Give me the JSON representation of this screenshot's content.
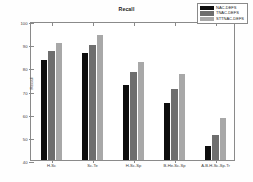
{
  "chart_data": {
    "type": "bar",
    "title": "Recall",
    "xlabel": "",
    "ylabel": "Recall",
    "ylim": [
      40,
      100
    ],
    "yticks": [
      40,
      50,
      60,
      70,
      80,
      90,
      100
    ],
    "grid": false,
    "legend_position": "top-right",
    "categories": [
      "H-Sc",
      "Sc-Te",
      "H-Sc-Sp",
      "B-He-Sc-Sp",
      "A-B-H-Sc-Sp-Tr"
    ],
    "series": [
      {
        "name": "NAC-DEFS",
        "color": "#0d0d0d",
        "values": [
          83.0,
          86.0,
          72.5,
          64.5,
          46.0
        ]
      },
      {
        "name": "TNAC-DEFS",
        "color": "#6e6e6e",
        "values": [
          87.0,
          89.5,
          78.0,
          70.5,
          51.0
        ]
      },
      {
        "name": "STTNAC-DEFS",
        "color": "#a8a8a8",
        "values": [
          90.5,
          94.0,
          82.5,
          77.0,
          58.0
        ]
      }
    ]
  }
}
